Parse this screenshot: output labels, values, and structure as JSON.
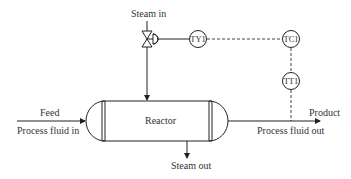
{
  "diagram": {
    "type": "process-flow (P&ID)",
    "colors": {
      "line": "#222222",
      "text": "#333333",
      "background": "#ffffff"
    },
    "labels": {
      "steam_in": "Steam in",
      "feed": "Feed",
      "process_fluid_in": "Process fluid in",
      "reactor": "Reactor",
      "steam_out": "Steam out",
      "product": "Product",
      "process_fluid_out": "Process fluid out"
    },
    "instruments": [
      {
        "id": "TY1",
        "label": "TY1"
      },
      {
        "id": "TC1",
        "label": "TC1"
      },
      {
        "id": "TT1",
        "label": "TT1"
      }
    ],
    "connections": [
      {
        "from": "Steam in",
        "to": "control-valve",
        "style": "solid"
      },
      {
        "from": "control-valve",
        "to": "Reactor",
        "style": "solid-arrow"
      },
      {
        "from": "control-valve-actuator",
        "to": "TY1",
        "style": "solid"
      },
      {
        "from": "TY1",
        "to": "TC1",
        "style": "dashed"
      },
      {
        "from": "TC1",
        "to": "TT1",
        "style": "dashed"
      },
      {
        "from": "TT1",
        "to": "Process fluid out line",
        "style": "dashed"
      },
      {
        "from": "Feed",
        "to": "Reactor",
        "style": "solid-arrow"
      },
      {
        "from": "Reactor",
        "to": "Product",
        "style": "solid-arrow"
      },
      {
        "from": "Reactor",
        "to": "Steam out",
        "style": "solid-arrow"
      }
    ]
  }
}
